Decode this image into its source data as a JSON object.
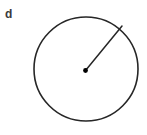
{
  "figure": {
    "label": "d",
    "background_color": "#ffffff",
    "stroke_color": "#262626",
    "label_color": "#3b3b3b",
    "dot_color": "#000000",
    "canvas": {
      "width": 147,
      "height": 135
    },
    "circle": {
      "center_x": 86,
      "center_y": 69,
      "radius": 52,
      "stroke_width": 1.6,
      "fill": "none"
    },
    "center_dot": {
      "x": 85.5,
      "y": 70.5,
      "radius": 2.4
    },
    "radius_line": {
      "x1": 85.5,
      "y1": 70.5,
      "x2": 122,
      "y2": 26,
      "stroke_width": 1.5
    }
  }
}
